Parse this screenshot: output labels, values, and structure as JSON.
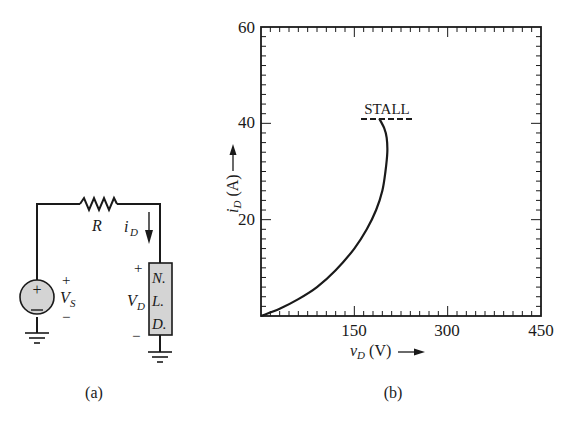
{
  "circuit": {
    "resistor_label": "R",
    "current_label": "i",
    "current_sub": "D",
    "source_label": "V",
    "source_sub": "S",
    "source_plus": "+",
    "source_minus": "−",
    "device_voltage_label": "V",
    "device_voltage_sub": "D",
    "device_plus": "+",
    "device_minus": "−",
    "device_text": [
      "N.",
      "L.",
      "D."
    ],
    "caption": "(a)",
    "colors": {
      "source_fill": "#d4d4d4",
      "device_fill": "#d4d4d4",
      "wire": "#1a1a1a"
    }
  },
  "plot": {
    "caption": "(b)",
    "stall_label": "STALL",
    "y_axis_label": "i",
    "y_axis_sub": "D",
    "y_axis_unit": " (A)",
    "x_axis_label": "v",
    "x_axis_sub": "D",
    "x_axis_unit": " (V)",
    "y_ticks": [
      "60",
      "40",
      "20"
    ],
    "x_ticks": [
      "150",
      "300",
      "450"
    ]
  },
  "chart_data": {
    "type": "line",
    "title": "",
    "xlabel": "v_D (V)",
    "ylabel": "i_D (A)",
    "xlim": [
      0,
      450
    ],
    "ylim": [
      0,
      60
    ],
    "x_ticks": [
      150,
      300,
      450
    ],
    "y_ticks": [
      20,
      40,
      60
    ],
    "grid": false,
    "series": [
      {
        "name": "N.L.D. characteristic",
        "x": [
          0,
          30,
          60,
          90,
          120,
          150,
          170,
          185,
          195,
          200,
          203,
          202,
          198,
          190
        ],
        "y": [
          0,
          1.5,
          3.5,
          6,
          9.5,
          14,
          18,
          22,
          26,
          30,
          34,
          37,
          39,
          41
        ]
      }
    ],
    "annotations": [
      {
        "text": "STALL",
        "x": 190,
        "y": 41,
        "style": "dashed horizontal line from v_D≈165 to v_D≈275"
      }
    ]
  }
}
